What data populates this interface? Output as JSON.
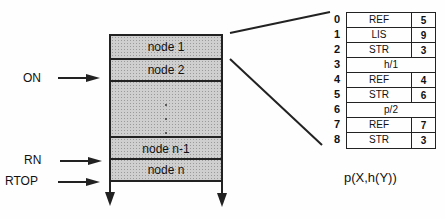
{
  "stack": {
    "nodes": [
      {
        "label": "node 1"
      },
      {
        "label": "node 2"
      },
      {
        "label": "node n-1"
      },
      {
        "label": "node n"
      }
    ],
    "pointers": {
      "on": "ON",
      "rn": "RN",
      "rtop": "RTOP"
    }
  },
  "table": {
    "rows": [
      {
        "index": "0",
        "tag": "REF",
        "value": "5"
      },
      {
        "index": "1",
        "tag": "LIS",
        "value": "9"
      },
      {
        "index": "2",
        "tag": "STR",
        "value": "3"
      },
      {
        "index": "3",
        "full": "h/1"
      },
      {
        "index": "4",
        "tag": "REF",
        "value": "4"
      },
      {
        "index": "5",
        "tag": "STR",
        "value": "6"
      },
      {
        "index": "6",
        "full": "p/2"
      },
      {
        "index": "7",
        "tag": "REF",
        "value": "7"
      },
      {
        "index": "8",
        "tag": "STR",
        "value": "3"
      }
    ],
    "caption": "p(X,h(Y))"
  }
}
